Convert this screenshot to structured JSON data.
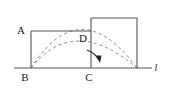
{
  "figure": {
    "canvas": {
      "width": 170,
      "height": 97,
      "background": "#ffffff"
    },
    "stroke_color": "#555555",
    "dash_color": "#888888",
    "label_color": "#222222",
    "labels": {
      "A": "A",
      "B": "B",
      "C": "C",
      "D": "D",
      "line": "l"
    },
    "label_positions": {
      "A": {
        "x": 21,
        "y": 34
      },
      "B": {
        "x": 24,
        "y": 81
      },
      "C": {
        "x": 87,
        "y": 81
      },
      "D": {
        "x": 81,
        "y": 42
      },
      "line": {
        "x": 155,
        "y": 70
      }
    },
    "points": {
      "A": {
        "x": 31,
        "y": 31
      },
      "B": {
        "x": 31,
        "y": 68
      },
      "C": {
        "x": 91,
        "y": 68
      },
      "D": {
        "x": 91,
        "y": 31
      },
      "E": {
        "x": 91,
        "y": 18
      },
      "F": {
        "x": 137,
        "y": 18
      },
      "G": {
        "x": 137,
        "y": 68
      }
    },
    "baseline": {
      "x1": 14,
      "y1": 68,
      "x2": 152,
      "y2": 68
    },
    "segments": [
      {
        "name": "segment-AB",
        "x1": 31,
        "y1": 31,
        "x2": 31,
        "y2": 68
      },
      {
        "name": "segment-AD",
        "x1": 31,
        "y1": 31,
        "x2": 91,
        "y2": 31
      },
      {
        "name": "segment-DC",
        "x1": 91,
        "y1": 18,
        "x2": 91,
        "y2": 68
      },
      {
        "name": "segment-EF",
        "x1": 91,
        "y1": 18,
        "x2": 137,
        "y2": 18
      },
      {
        "name": "segment-FG",
        "x1": 137,
        "y1": 18,
        "x2": 137,
        "y2": 68
      }
    ],
    "arcs": [
      {
        "name": "outer-arc",
        "d": "M 31 68 Q 80 -9 137 68",
        "dash": "3 3"
      },
      {
        "name": "inner-arc",
        "d": "M 31 68 Q 74 14 137 68",
        "dash": "3 3"
      }
    ],
    "arrow": {
      "name": "rotation-arrow",
      "path": "M 87 50 Q 95 53 100 61",
      "head": "100,62 95,56 99,55"
    }
  }
}
